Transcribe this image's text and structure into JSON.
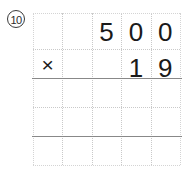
{
  "problem": {
    "number_label": "Ⓔ",
    "number_text": "10",
    "operation": "multiplication",
    "operator_symbol": "×",
    "multiplicand": "500",
    "multiplier": "19",
    "answer": "",
    "multiplicand_digits": [
      "",
      "",
      "5",
      "0",
      "0"
    ],
    "multiplier_digits": [
      "×",
      "",
      "",
      "1",
      "9"
    ]
  },
  "grid": {
    "columns": 5,
    "rows": 5,
    "line_style": "dotted",
    "line_color": "#c9c9c9",
    "rule_color": "#888888",
    "background": "#ffffff"
  },
  "colors": {
    "ink": "#1a1a1a",
    "grid": "#c9c9c9",
    "rule": "#888888"
  }
}
